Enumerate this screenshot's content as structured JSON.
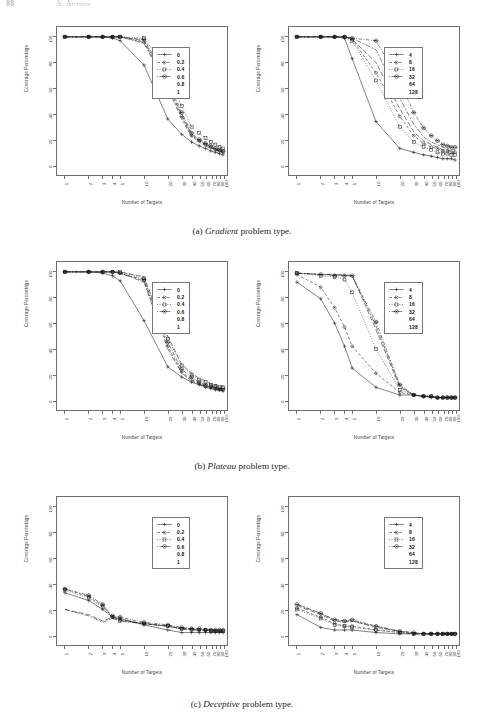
{
  "header": {
    "page_number": "88",
    "running_head": "A. Author"
  },
  "figure": {
    "captions": [
      {
        "tag": "(a)",
        "name": "Gradient",
        "suffix": " problem type."
      },
      {
        "tag": "(b)",
        "name": "Plateau",
        "suffix": " problem type."
      },
      {
        "tag": "(c)",
        "name": "Deceptive",
        "suffix": " problem type."
      }
    ]
  },
  "axes": {
    "xlabel": "Number of Targets",
    "ylabel": "Coverage Percentage",
    "xticks": [
      "1",
      "2",
      "3",
      "4",
      "5",
      "10",
      "20",
      "30",
      "40",
      "50",
      "60",
      "70",
      "80",
      "90",
      "100"
    ],
    "yticks": [
      "100",
      "80",
      "60",
      "40",
      "20",
      "0"
    ],
    "xlim": [
      1,
      100
    ],
    "ylim": [
      0,
      100
    ],
    "xscale": "log",
    "grid": false
  },
  "legends": {
    "mutation": {
      "title": "",
      "entries": [
        "0",
        "0.2",
        "0.4",
        "0.6",
        "0.8",
        "1"
      ],
      "position": "upper-right"
    },
    "population": {
      "title": "",
      "entries": [
        "4",
        "8",
        "16",
        "32",
        "64",
        "128"
      ],
      "position": "upper-right"
    }
  },
  "markers": [
    "plus",
    "circle-dot",
    "open-square",
    "circled-dot",
    "none",
    "none"
  ],
  "chart_data": [
    {
      "id": "gradient-mutation",
      "type": "line",
      "title": "Gradient problem type - mutation rate",
      "xlabel": "Number of Targets",
      "ylabel": "Coverage Percentage",
      "xscale": "log",
      "xlim": [
        1,
        100
      ],
      "ylim": [
        0,
        100
      ],
      "grid": false,
      "legend": "upper-right",
      "x": [
        1,
        2,
        3,
        4,
        5,
        10,
        20,
        30,
        40,
        50,
        60,
        70,
        80,
        90,
        100
      ],
      "series": [
        {
          "name": "0",
          "marker": "plus",
          "dash": "solid",
          "values": [
            100,
            100,
            100,
            99,
            97,
            78,
            36,
            24,
            18,
            15,
            13,
            11,
            10,
            9,
            8
          ]
        },
        {
          "name": "0.2",
          "marker": "circle-dot",
          "dash": "dashed",
          "values": [
            100,
            100,
            100,
            100,
            100,
            96,
            62,
            38,
            23,
            19,
            16,
            14,
            12,
            11,
            10
          ]
        },
        {
          "name": "0.4",
          "marker": "open-square",
          "dash": "dotted",
          "values": [
            100,
            100,
            100,
            100,
            100,
            99,
            74,
            46,
            30,
            25,
            21,
            18,
            16,
            14,
            13
          ]
        },
        {
          "name": "0.6",
          "marker": "circled-dot",
          "dash": "dotdash",
          "values": [
            100,
            100,
            100,
            100,
            100,
            98,
            66,
            41,
            25,
            20,
            17,
            15,
            13,
            12,
            11
          ]
        },
        {
          "name": "0.8",
          "marker": "none",
          "dash": "longdash",
          "values": [
            100,
            100,
            100,
            100,
            100,
            97,
            64,
            39,
            24,
            19,
            16,
            14,
            12,
            11,
            10
          ]
        },
        {
          "name": "1",
          "marker": "none",
          "dash": "twodash",
          "values": [
            100,
            100,
            100,
            100,
            100,
            95,
            60,
            36,
            22,
            18,
            15,
            13,
            12,
            11,
            10
          ]
        }
      ]
    },
    {
      "id": "gradient-population",
      "type": "line",
      "title": "Gradient problem type - population size",
      "xlabel": "Number of Targets",
      "ylabel": "Coverage Percentage",
      "xscale": "log",
      "xlim": [
        1,
        100
      ],
      "ylim": [
        0,
        100
      ],
      "grid": false,
      "legend": "upper-right",
      "x": [
        1,
        2,
        3,
        4,
        5,
        10,
        20,
        30,
        40,
        50,
        60,
        70,
        80,
        90,
        100
      ],
      "series": [
        {
          "name": "4",
          "marker": "plus",
          "dash": "solid",
          "values": [
            100,
            100,
            100,
            99,
            83,
            34,
            13,
            10,
            8,
            7,
            6,
            5,
            5,
            5,
            4
          ]
        },
        {
          "name": "8",
          "marker": "circle-dot",
          "dash": "dashed",
          "values": [
            100,
            100,
            100,
            100,
            98,
            72,
            38,
            23,
            17,
            14,
            13,
            11,
            11,
            10,
            10
          ]
        },
        {
          "name": "16",
          "marker": "open-square",
          "dash": "dotted",
          "values": [
            100,
            100,
            100,
            100,
            97,
            66,
            30,
            18,
            14,
            12,
            10,
            9,
            9,
            8,
            8
          ]
        },
        {
          "name": "32",
          "marker": "circled-dot",
          "dash": "dotdash",
          "values": [
            100,
            100,
            100,
            100,
            99,
            97,
            65,
            41,
            29,
            23,
            19,
            16,
            15,
            14,
            14
          ]
        },
        {
          "name": "64",
          "marker": "none",
          "dash": "longdash",
          "values": [
            100,
            100,
            100,
            100,
            98,
            80,
            44,
            26,
            19,
            16,
            14,
            12,
            12,
            11,
            11
          ]
        },
        {
          "name": "128",
          "marker": "none",
          "dash": "twodash",
          "values": [
            100,
            100,
            100,
            100,
            99,
            90,
            52,
            32,
            22,
            18,
            16,
            14,
            13,
            12,
            12
          ]
        }
      ]
    },
    {
      "id": "plateau-mutation",
      "type": "line",
      "title": "Plateau problem type - mutation rate",
      "xlabel": "Number of Targets",
      "ylabel": "Coverage Percentage",
      "xscale": "log",
      "xlim": [
        1,
        100
      ],
      "ylim": [
        0,
        100
      ],
      "grid": false,
      "legend": "upper-right",
      "x": [
        1,
        2,
        3,
        4,
        5,
        10,
        20,
        30,
        40,
        50,
        60,
        70,
        80,
        90,
        100
      ],
      "series": [
        {
          "name": "0",
          "marker": "plus",
          "dash": "solid",
          "values": [
            100,
            100,
            99,
            97,
            93,
            62,
            26,
            18,
            14,
            12,
            10,
            9,
            8,
            8,
            7
          ]
        },
        {
          "name": "0.2",
          "marker": "circle-dot",
          "dash": "dashed",
          "values": [
            100,
            100,
            100,
            100,
            99,
            93,
            42,
            22,
            16,
            13,
            11,
            10,
            9,
            8,
            8
          ]
        },
        {
          "name": "0.4",
          "marker": "open-square",
          "dash": "dotted",
          "values": [
            100,
            100,
            100,
            100,
            100,
            95,
            48,
            27,
            20,
            16,
            14,
            12,
            11,
            10,
            10
          ]
        },
        {
          "name": "0.6",
          "marker": "circled-dot",
          "dash": "dotdash",
          "values": [
            100,
            100,
            100,
            100,
            99,
            94,
            45,
            24,
            18,
            14,
            12,
            11,
            10,
            9,
            9
          ]
        },
        {
          "name": "0.8",
          "marker": "none",
          "dash": "longdash",
          "values": [
            100,
            100,
            100,
            100,
            100,
            96,
            50,
            28,
            21,
            17,
            15,
            13,
            12,
            11,
            11
          ]
        },
        {
          "name": "1",
          "marker": "none",
          "dash": "twodash",
          "values": [
            100,
            100,
            100,
            100,
            99,
            92,
            40,
            21,
            15,
            12,
            11,
            10,
            9,
            8,
            8
          ]
        }
      ]
    },
    {
      "id": "plateau-population",
      "type": "line",
      "title": "Plateau problem type - population size",
      "xlabel": "Number of Targets",
      "ylabel": "Coverage Percentage",
      "xscale": "log",
      "xlim": [
        1,
        100
      ],
      "ylim": [
        0,
        100
      ],
      "grid": false,
      "legend": "upper-right",
      "x": [
        1,
        2,
        3,
        4,
        5,
        10,
        20,
        30,
        40,
        50,
        60,
        70,
        80,
        90,
        100
      ],
      "series": [
        {
          "name": "4",
          "marker": "plus",
          "dash": "solid",
          "values": [
            92,
            79,
            60,
            42,
            25,
            10,
            4,
            4,
            3,
            2,
            2,
            2,
            2,
            2,
            2
          ]
        },
        {
          "name": "8",
          "marker": "circle-dot",
          "dash": "dashed",
          "values": [
            98,
            88,
            72,
            57,
            42,
            21,
            6,
            4,
            3,
            3,
            2,
            2,
            2,
            2,
            2
          ]
        },
        {
          "name": "16",
          "marker": "open-square",
          "dash": "dotted",
          "values": [
            99,
            97,
            96,
            94,
            84,
            40,
            8,
            4,
            3,
            3,
            2,
            2,
            2,
            2,
            2
          ]
        },
        {
          "name": "32",
          "marker": "circled-dot",
          "dash": "dotdash",
          "values": [
            99,
            98,
            97,
            97,
            97,
            61,
            12,
            4,
            3,
            3,
            2,
            2,
            2,
            2,
            2
          ]
        },
        {
          "name": "64",
          "marker": "none",
          "dash": "longdash",
          "values": [
            99,
            98,
            98,
            97,
            97,
            55,
            10,
            4,
            3,
            3,
            2,
            2,
            2,
            2,
            2
          ]
        },
        {
          "name": "128",
          "marker": "none",
          "dash": "twodash",
          "values": [
            99,
            98,
            98,
            98,
            97,
            58,
            11,
            4,
            3,
            3,
            2,
            2,
            2,
            2,
            2
          ]
        }
      ]
    },
    {
      "id": "deceptive-mutation",
      "type": "line",
      "title": "Deceptive problem type - mutation rate",
      "xlabel": "Number of Targets",
      "ylabel": "Coverage Percentage",
      "xscale": "log",
      "xlim": [
        1,
        100
      ],
      "ylim": [
        0,
        100
      ],
      "grid": false,
      "legend": "upper-right",
      "x": [
        1,
        2,
        3,
        4,
        5,
        10,
        20,
        30,
        40,
        50,
        60,
        70,
        80,
        90,
        100
      ],
      "series": [
        {
          "name": "0",
          "marker": "plus",
          "dash": "solid",
          "values": [
            33,
            27,
            20,
            14,
            13,
            8,
            4,
            2,
            2,
            2,
            2,
            2,
            2,
            2,
            2
          ]
        },
        {
          "name": "0.2",
          "marker": "circle-dot",
          "dash": "dashed",
          "values": [
            36,
            30,
            23,
            14,
            12,
            9,
            7,
            5,
            5,
            4,
            4,
            4,
            3,
            3,
            3
          ]
        },
        {
          "name": "0.4",
          "marker": "open-square",
          "dash": "dotted",
          "values": [
            35,
            29,
            22,
            14,
            11,
            9,
            7,
            5,
            4,
            4,
            4,
            3,
            3,
            3,
            3
          ]
        },
        {
          "name": "0.6",
          "marker": "circled-dot",
          "dash": "dotdash",
          "values": [
            36,
            31,
            24,
            15,
            14,
            10,
            8,
            6,
            5,
            5,
            4,
            4,
            4,
            4,
            4
          ]
        },
        {
          "name": "0.8",
          "marker": "none",
          "dash": "longdash",
          "values": [
            20,
            16,
            11,
            14,
            12,
            9,
            7,
            5,
            5,
            4,
            4,
            4,
            4,
            3,
            3
          ]
        },
        {
          "name": "1",
          "marker": "none",
          "dash": "twodash",
          "values": [
            20,
            15,
            10,
            13,
            11,
            9,
            7,
            5,
            4,
            4,
            4,
            3,
            3,
            3,
            3
          ]
        }
      ]
    },
    {
      "id": "deceptive-population",
      "type": "line",
      "title": "Deceptive problem type - population size",
      "xlabel": "Number of Targets",
      "ylabel": "Coverage Percentage",
      "xscale": "log",
      "xlim": [
        1,
        100
      ],
      "ylim": [
        0,
        100
      ],
      "grid": false,
      "legend": "upper-right",
      "x": [
        1,
        2,
        3,
        4,
        5,
        10,
        20,
        30,
        40,
        50,
        60,
        70,
        80,
        90,
        100
      ],
      "series": [
        {
          "name": "4",
          "marker": "plus",
          "dash": "solid",
          "values": [
            16,
            6,
            4,
            4,
            4,
            2,
            1,
            1,
            1,
            1,
            1,
            1,
            1,
            1,
            1
          ]
        },
        {
          "name": "8",
          "marker": "circle-dot",
          "dash": "dashed",
          "values": [
            21,
            14,
            9,
            7,
            7,
            4,
            2,
            1,
            1,
            1,
            1,
            1,
            1,
            1,
            1
          ]
        },
        {
          "name": "16",
          "marker": "open-square",
          "dash": "dotted",
          "values": [
            20,
            13,
            8,
            7,
            6,
            4,
            2,
            1,
            1,
            1,
            1,
            1,
            1,
            1,
            1
          ]
        },
        {
          "name": "32",
          "marker": "circled-dot",
          "dash": "dotdash",
          "values": [
            24,
            17,
            12,
            11,
            12,
            7,
            3,
            2,
            1,
            1,
            1,
            1,
            1,
            1,
            1
          ]
        },
        {
          "name": "64",
          "marker": "none",
          "dash": "longdash",
          "values": [
            23,
            16,
            11,
            10,
            11,
            6,
            3,
            1,
            1,
            1,
            1,
            1,
            1,
            1,
            1
          ]
        },
        {
          "name": "128",
          "marker": "none",
          "dash": "twodash",
          "values": [
            24,
            17,
            12,
            11,
            11,
            7,
            3,
            2,
            1,
            1,
            1,
            1,
            1,
            1,
            1
          ]
        }
      ]
    }
  ]
}
